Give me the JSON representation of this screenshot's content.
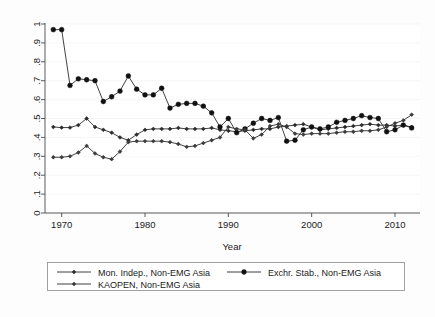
{
  "chart_data": {
    "type": "line",
    "title": "",
    "xlabel": "Year",
    "ylabel": "",
    "xlim": [
      1968,
      2013
    ],
    "ylim": [
      0,
      1
    ],
    "grid": true,
    "legend_position": "bottom",
    "xticks": [
      1970,
      1980,
      1990,
      2000,
      2010
    ],
    "xtick_labels": [
      "1970",
      "1980",
      "1990",
      "2000",
      "2010"
    ],
    "yticks": [
      0,
      0.1,
      0.2,
      0.3,
      0.4,
      0.5,
      0.6,
      0.7,
      0.8,
      0.9,
      1
    ],
    "ytick_labels": [
      "0",
      ".1",
      ".2",
      ".3",
      ".4",
      ".5",
      ".6",
      ".7",
      ".8",
      ".9",
      "1"
    ],
    "x": [
      1969,
      1970,
      1971,
      1972,
      1973,
      1974,
      1975,
      1976,
      1977,
      1978,
      1979,
      1980,
      1981,
      1982,
      1983,
      1984,
      1985,
      1986,
      1987,
      1988,
      1989,
      1990,
      1991,
      1992,
      1993,
      1994,
      1995,
      1996,
      1997,
      1998,
      1999,
      2000,
      2001,
      2002,
      2003,
      2004,
      2005,
      2006,
      2007,
      2008,
      2009,
      2010,
      2011,
      2012
    ],
    "series": [
      {
        "name": "Mon. Indep., Non-EMG Asia",
        "marker": "diamond-small",
        "color": "#2b2b2b",
        "values": [
          0.455,
          0.452,
          0.452,
          0.465,
          0.5,
          0.455,
          0.44,
          0.425,
          0.4,
          0.385,
          0.415,
          0.44,
          0.445,
          0.445,
          0.445,
          0.45,
          0.445,
          0.445,
          0.445,
          0.45,
          0.44,
          0.435,
          0.43,
          0.435,
          0.44,
          0.445,
          0.445,
          0.455,
          0.46,
          0.465,
          0.47,
          0.455,
          0.44,
          0.445,
          0.45,
          0.455,
          0.46,
          0.465,
          0.47,
          0.465,
          0.465,
          0.46,
          0.465,
          0.455
        ]
      },
      {
        "name": "Exchr. Stab., Non-EMG Asia",
        "marker": "circle-filled",
        "color": "#111111",
        "values": [
          0.97,
          0.97,
          0.675,
          0.71,
          0.705,
          0.7,
          0.59,
          0.615,
          0.645,
          0.725,
          0.655,
          0.625,
          0.625,
          0.66,
          0.555,
          0.575,
          0.58,
          0.58,
          0.565,
          0.53,
          0.455,
          0.5,
          0.425,
          0.445,
          0.475,
          0.5,
          0.49,
          0.505,
          0.38,
          0.385,
          0.44,
          0.455,
          0.445,
          0.455,
          0.48,
          0.49,
          0.5,
          0.515,
          0.505,
          0.5,
          0.43,
          0.44,
          0.465,
          0.45
        ]
      },
      {
        "name": "KAOPEN, Non-EMG Asia",
        "marker": "diamond-small",
        "color": "#3a3a3a",
        "values": [
          0.295,
          0.295,
          0.3,
          0.32,
          0.355,
          0.315,
          0.295,
          0.285,
          0.325,
          0.375,
          0.38,
          0.38,
          0.38,
          0.38,
          0.375,
          0.365,
          0.35,
          0.355,
          0.37,
          0.385,
          0.4,
          0.455,
          0.445,
          0.44,
          0.395,
          0.415,
          0.46,
          0.47,
          0.455,
          0.42,
          0.415,
          0.42,
          0.42,
          0.42,
          0.425,
          0.43,
          0.43,
          0.435,
          0.435,
          0.44,
          0.455,
          0.475,
          0.49,
          0.52
        ]
      }
    ]
  },
  "legend": {
    "entries": [
      {
        "label": "Mon. Indep., Non-EMG Asia"
      },
      {
        "label": "Exchr. Stab., Non-EMG Asia"
      },
      {
        "label": "KAOPEN, Non-EMG Asia"
      }
    ]
  },
  "axes": {
    "x_title": "Year"
  }
}
